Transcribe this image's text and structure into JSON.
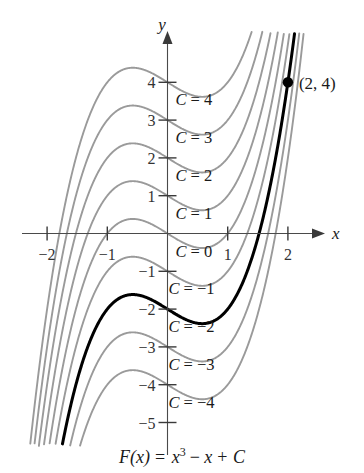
{
  "figure": {
    "caption": "F(x) = x³ − x + C",
    "caption_parts": {
      "fname": "F",
      "arg": "(x)",
      "equals": "= ",
      "var": "x",
      "exp": "3",
      "rest_minus": "− ",
      "rest_var": "x",
      "plus": "+ ",
      "const": "C"
    },
    "axes": {
      "x_label": "x",
      "y_label": "y",
      "x_ticks": [
        {
          "value": -2,
          "label": "−2"
        },
        {
          "value": -1,
          "label": "−1"
        },
        {
          "value": 1,
          "label": "1"
        },
        {
          "value": 2,
          "label": "2"
        }
      ],
      "y_ticks": [
        {
          "value": 4,
          "label": "4"
        },
        {
          "value": 3,
          "label": "3"
        },
        {
          "value": 2,
          "label": "2"
        },
        {
          "value": 1,
          "label": "1"
        },
        {
          "value": -1,
          "label": "−1"
        },
        {
          "value": -2,
          "label": "−2"
        },
        {
          "value": -3,
          "label": "−3"
        },
        {
          "value": -4,
          "label": "−4"
        },
        {
          "value": -5,
          "label": "−5"
        }
      ]
    },
    "annotations": {
      "point_label": "(2, 4)",
      "point_x": 2,
      "point_y": 4
    },
    "curve_labels": [
      {
        "text": "C = 4",
        "c": 4
      },
      {
        "text": "C = 3",
        "c": 3
      },
      {
        "text": "C = 2",
        "c": 2
      },
      {
        "text": "C = 1",
        "c": 1
      },
      {
        "text": "C = 0",
        "c": 0
      },
      {
        "text": "C = −1",
        "c": -1
      },
      {
        "text": "C = −2",
        "c": -2
      },
      {
        "text": "C = −3",
        "c": -3
      },
      {
        "text": "C = −4",
        "c": -4
      }
    ],
    "colors": {
      "curve_gray": "#9a9a9a",
      "curve_highlight": "#000000",
      "axis": "#4a4a4a",
      "background": "#ffffff"
    }
  },
  "chart_data": {
    "type": "line",
    "xlabel": "x",
    "ylabel": "y",
    "xlim": [
      -2.45,
      3.25
    ],
    "ylim": [
      -5.6,
      5.3
    ],
    "grid": false,
    "legend": "inline-curve-labels",
    "function": "F(x) = x^3 - x + C",
    "x_ticks": [
      -2,
      -1,
      1,
      2
    ],
    "y_ticks": [
      4,
      3,
      2,
      1,
      -1,
      -2,
      -3,
      -4,
      -5
    ],
    "annotations": [
      {
        "label": "(2, 4)",
        "x": 2,
        "y": 4,
        "marker": "filled-circle"
      }
    ],
    "series": [
      {
        "name": "C = 4",
        "c": 4,
        "highlight": false,
        "color": "#9a9a9a"
      },
      {
        "name": "C = 3",
        "c": 3,
        "highlight": false,
        "color": "#9a9a9a"
      },
      {
        "name": "C = 2",
        "c": 2,
        "highlight": false,
        "color": "#9a9a9a"
      },
      {
        "name": "C = 1",
        "c": 1,
        "highlight": false,
        "color": "#9a9a9a"
      },
      {
        "name": "C = 0",
        "c": 0,
        "highlight": false,
        "color": "#9a9a9a"
      },
      {
        "name": "C = -1",
        "c": -1,
        "highlight": false,
        "color": "#9a9a9a"
      },
      {
        "name": "C = -2",
        "c": -2,
        "highlight": true,
        "color": "#000000"
      },
      {
        "name": "C = -3",
        "c": -3,
        "highlight": false,
        "color": "#9a9a9a"
      },
      {
        "name": "C = -4",
        "c": -4,
        "highlight": false,
        "color": "#9a9a9a"
      }
    ]
  }
}
